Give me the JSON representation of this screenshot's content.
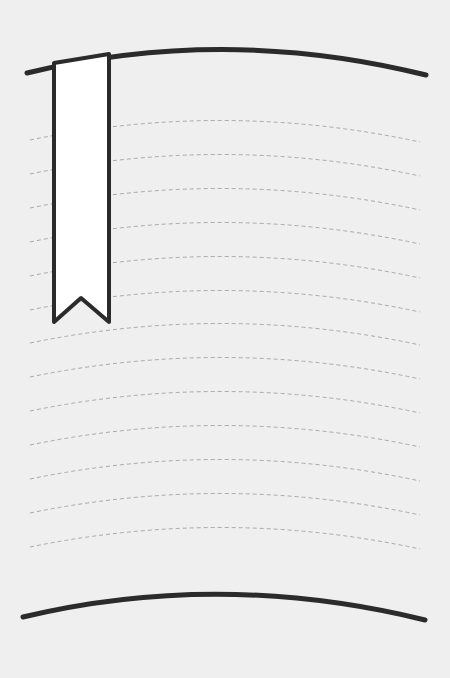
{
  "page": {
    "background": "#efefef",
    "ink_color": "#2b2b2b",
    "rule_color": "#a9a9a9",
    "ruled_line_count": 13,
    "ruled_line_peaks_y": [
      120,
      154,
      188,
      222,
      256,
      290,
      323,
      357,
      391,
      425,
      459,
      493,
      527
    ]
  },
  "icons": {
    "bookmark": "bookmark-ribbon-icon"
  }
}
